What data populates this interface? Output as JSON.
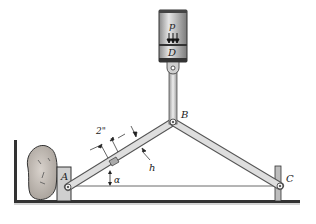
{
  "diagram": {
    "type": "mechanism",
    "labels": {
      "pressure": "p",
      "piston": "D",
      "joint_b": "B",
      "pin_a": "A",
      "pin_c": "C",
      "angle": "α",
      "width_dim": "2\"",
      "thickness_dim": "h"
    },
    "colors": {
      "link_fill": "#d8d8d8",
      "link_stroke": "#555555",
      "cylinder_fill": "#c9c9c9",
      "ground": "#333333",
      "rock": "#c8c2bc"
    }
  }
}
